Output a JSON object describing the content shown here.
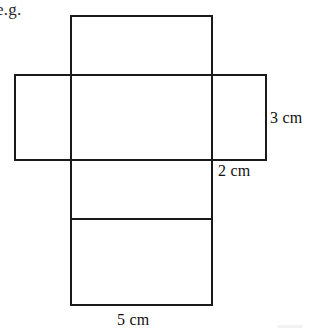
{
  "document": {
    "kind": "geometry-figure",
    "background_color": "#ffffff",
    "line_color": "#1a1a1a",
    "text_color": "#111111",
    "width": 317,
    "height": 334
  },
  "annotations": {
    "example_prefix": "e.g."
  },
  "figure": {
    "name": "net-of-cuboid",
    "stroke_width": 2,
    "faces": [
      {
        "id": "top-flap",
        "x": 71,
        "y": 16,
        "w": 141,
        "h": 59
      },
      {
        "id": "left-flap",
        "x": 15,
        "y": 75,
        "w": 56,
        "h": 85
      },
      {
        "id": "center",
        "x": 71,
        "y": 75,
        "w": 141,
        "h": 85
      },
      {
        "id": "right-flap",
        "x": 212,
        "y": 75,
        "w": 54,
        "h": 85
      },
      {
        "id": "lower-upper",
        "x": 71,
        "y": 160,
        "w": 141,
        "h": 59
      },
      {
        "id": "lower-base",
        "x": 71,
        "y": 219,
        "w": 141,
        "h": 86
      }
    ]
  },
  "measurements": [
    {
      "id": "height-label",
      "value": "3 cm",
      "edge": "right-flap-right-edge"
    },
    {
      "id": "depth-label",
      "value": "2 cm",
      "edge": "right-flap-width"
    },
    {
      "id": "width-label",
      "value": "5 cm",
      "edge": "base-bottom-edge"
    }
  ],
  "labels": {
    "three_cm": "3 cm",
    "two_cm": "2 cm",
    "five_cm": "5 cm"
  }
}
